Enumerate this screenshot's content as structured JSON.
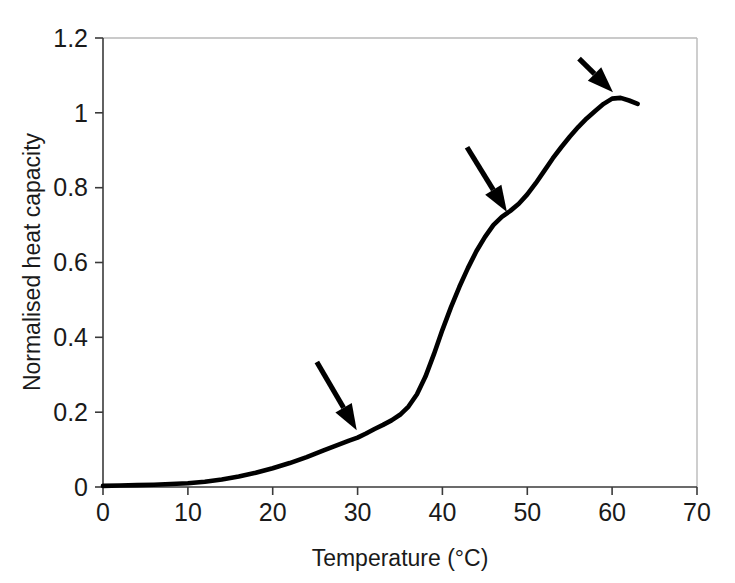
{
  "chart_data": {
    "type": "line",
    "title": "",
    "xlabel": "Temperature (°C)",
    "ylabel": "Normalised heat capacity",
    "xlim": [
      0,
      70
    ],
    "ylim": [
      0,
      1.2
    ],
    "xticks": [
      "0",
      "10",
      "20",
      "30",
      "40",
      "50",
      "60",
      "70"
    ],
    "xtick_values": [
      0,
      10,
      20,
      30,
      40,
      50,
      60,
      70
    ],
    "yticks": [
      "0",
      "0.2",
      "0.4",
      "0.6",
      "0.8",
      "1",
      "1.2"
    ],
    "ytick_values": [
      0,
      0.2,
      0.4,
      0.6,
      0.8,
      1,
      1.2
    ],
    "grid": false,
    "legend": null,
    "series": [
      {
        "name": "Normalised heat capacity",
        "color": "#000000",
        "x": [
          0,
          2,
          4,
          6,
          8,
          10,
          12,
          14,
          16,
          18,
          20,
          22,
          24,
          26,
          28,
          29,
          30,
          31,
          32,
          33,
          34,
          35,
          36,
          37,
          38,
          39,
          40,
          41,
          42,
          43,
          44,
          45,
          46,
          47,
          48,
          49,
          50,
          51,
          52,
          53,
          54,
          55,
          56,
          57,
          58,
          59,
          60,
          61,
          62,
          63
        ],
        "y": [
          0.003,
          0.004,
          0.005,
          0.006,
          0.008,
          0.01,
          0.014,
          0.02,
          0.028,
          0.038,
          0.05,
          0.064,
          0.08,
          0.098,
          0.115,
          0.124,
          0.132,
          0.143,
          0.155,
          0.166,
          0.178,
          0.193,
          0.215,
          0.248,
          0.295,
          0.355,
          0.42,
          0.48,
          0.535,
          0.585,
          0.63,
          0.668,
          0.7,
          0.722,
          0.738,
          0.757,
          0.782,
          0.812,
          0.845,
          0.878,
          0.908,
          0.936,
          0.962,
          0.985,
          1.005,
          1.024,
          1.038,
          1.04,
          1.033,
          1.024
        ]
      }
    ],
    "annotations": [
      {
        "name": "arrow-transition-1",
        "label": "arrow pointing to shoulder near 30 °C",
        "tail": [
          25.2,
          0.334
        ],
        "head": [
          29.9,
          0.152
        ],
        "target_x": 30,
        "target_y": 0.13
      },
      {
        "name": "arrow-transition-2",
        "label": "arrow pointing to shoulder near 48 °C",
        "tail": [
          42.9,
          0.908
        ],
        "head": [
          47.6,
          0.735
        ],
        "target_x": 48,
        "target_y": 0.74
      },
      {
        "name": "arrow-transition-3",
        "label": "arrow pointing to peak near 60 °C",
        "tail": [
          56.1,
          1.145
        ],
        "head": [
          60.1,
          1.055
        ],
        "target_x": 60,
        "target_y": 1.04
      }
    ]
  }
}
